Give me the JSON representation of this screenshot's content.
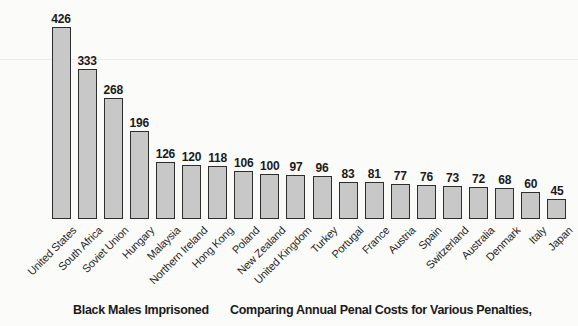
{
  "chart_data": {
    "type": "bar",
    "categories": [
      "United States",
      "South Africa",
      "Soviet Union",
      "Hungary",
      "Malaysia",
      "Northern Ireland",
      "Hong Kong",
      "Poland",
      "New Zealand",
      "United Kingdom",
      "Turkey",
      "Portugal",
      "France",
      "Austria",
      "Spain",
      "Switzerland",
      "Australia",
      "Denmark",
      "Italy",
      "Japan"
    ],
    "values": [
      426,
      333,
      268,
      196,
      126,
      120,
      118,
      106,
      100,
      97,
      96,
      83,
      81,
      77,
      76,
      73,
      72,
      68,
      60,
      45
    ],
    "title": "Black Males Imprisoned",
    "xlabel": "",
    "ylabel": "",
    "ylim": [
      0,
      450
    ],
    "grid": false,
    "legend_position": "none",
    "value_labels_shown": true,
    "bar_fill_color": "#c8c8c8",
    "bar_border_color": "#2e2e2e"
  },
  "captions": {
    "left": "Black Males Imprisoned",
    "right": "Comparing Annual Penal Costs for Various Penalties,"
  }
}
